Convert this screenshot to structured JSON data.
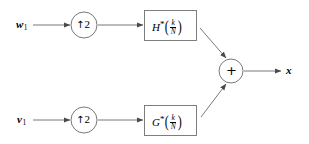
{
  "diagram": {
    "type": "block-diagram",
    "canvas": {
      "width": 309,
      "height": 144
    },
    "colors": {
      "background": "#ffffff",
      "stroke": "#555555",
      "text": "#000000",
      "box_border": "#666666"
    },
    "inputs": [
      {
        "id": "w1",
        "symbol": "w",
        "subscript": "1",
        "x": 22,
        "y": 25
      },
      {
        "id": "v1",
        "symbol": "v",
        "subscript": "1",
        "x": 22,
        "y": 120
      }
    ],
    "upsamplers": [
      {
        "id": "up-top",
        "arrow": "↑",
        "factor": "2",
        "cx": 84,
        "cy": 25,
        "r": 13
      },
      {
        "id": "up-bottom",
        "arrow": "↑",
        "factor": "2",
        "cx": 84,
        "cy": 120,
        "r": 13
      }
    ],
    "filters": [
      {
        "id": "filter-h",
        "name": "H",
        "conjugate": "*",
        "argument_numerator": "k",
        "argument_denominator": "N",
        "x": 144,
        "y": 10,
        "w": 53,
        "h": 31
      },
      {
        "id": "filter-g",
        "name": "G",
        "conjugate": "*",
        "argument_numerator": "k",
        "argument_denominator": "N",
        "x": 144,
        "y": 105,
        "w": 53,
        "h": 31
      }
    ],
    "adder": {
      "id": "adder",
      "operator": "+",
      "cx": 231,
      "cy": 71,
      "r": 12
    },
    "outputs": [
      {
        "id": "x",
        "symbol": "x",
        "subscript": "",
        "x": 289,
        "y": 71
      }
    ],
    "connections": [
      {
        "id": "w1-to-up-top",
        "from": "w1",
        "to": "up-top"
      },
      {
        "id": "up-top-to-filter-h",
        "from": "up-top",
        "to": "filter-h"
      },
      {
        "id": "filter-h-to-adder",
        "from": "filter-h",
        "to": "adder"
      },
      {
        "id": "v1-to-up-bottom",
        "from": "v1",
        "to": "up-bottom"
      },
      {
        "id": "up-bottom-to-filter-g",
        "from": "up-bottom",
        "to": "filter-g"
      },
      {
        "id": "filter-g-to-adder",
        "from": "filter-g",
        "to": "adder"
      },
      {
        "id": "adder-to-x",
        "from": "adder",
        "to": "x"
      }
    ]
  }
}
